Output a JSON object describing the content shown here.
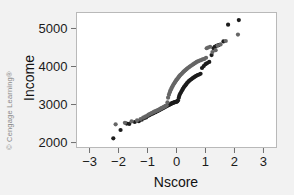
{
  "figure": {
    "credit": "© Cengage Learning®",
    "background_color": "#f2f2f2",
    "plot_background_color": "#ffffff",
    "frame_color": "#b9b9b9",
    "axis_color": "#6f6f6f"
  },
  "chart_data": {
    "type": "scatter",
    "title": "",
    "xlabel": "Nscore",
    "ylabel": "Income",
    "xlim": [
      -3.45,
      3.45
    ],
    "ylim": [
      1870,
      5420
    ],
    "xticks": [
      -3,
      -2,
      -1,
      0,
      1,
      2,
      3
    ],
    "xtick_labels": [
      "−3",
      "−2",
      "−1",
      "0",
      "1",
      "2",
      "3"
    ],
    "yticks": [
      2000,
      3000,
      4000,
      5000
    ],
    "ytick_labels": [
      "2000",
      "3000",
      "4000",
      "5000"
    ],
    "grid": false,
    "legend": "none",
    "marker": "filled-circle",
    "marker_size_px": 4.2,
    "series": [
      {
        "name": "lower-band",
        "color": "#1c1c1c",
        "points": [
          [
            -2.18,
            2110
          ],
          [
            -1.93,
            2330
          ],
          [
            -1.72,
            2500
          ],
          [
            -1.63,
            2490
          ],
          [
            -1.44,
            2540
          ],
          [
            -1.3,
            2560
          ],
          [
            -1.2,
            2600
          ],
          [
            -1.12,
            2640
          ],
          [
            -1.05,
            2660
          ],
          [
            -0.99,
            2700
          ],
          [
            -0.94,
            2720
          ],
          [
            -0.89,
            2740
          ],
          [
            -0.84,
            2760
          ],
          [
            -0.8,
            2770
          ],
          [
            -0.76,
            2790
          ],
          [
            -0.72,
            2800
          ],
          [
            -0.68,
            2820
          ],
          [
            -0.64,
            2830
          ],
          [
            -0.61,
            2850
          ],
          [
            -0.57,
            2860
          ],
          [
            -0.54,
            2880
          ],
          [
            -0.51,
            2890
          ],
          [
            -0.48,
            2900
          ],
          [
            -0.45,
            2915
          ],
          [
            -0.42,
            2925
          ],
          [
            -0.39,
            2940
          ],
          [
            -0.36,
            2950
          ],
          [
            -0.33,
            2965
          ],
          [
            -0.3,
            2975
          ],
          [
            -0.28,
            2985
          ],
          [
            -0.25,
            2995
          ],
          [
            -0.22,
            3005
          ],
          [
            -0.2,
            3015
          ],
          [
            -0.17,
            3025
          ],
          [
            -0.15,
            3035
          ],
          [
            -0.12,
            3045
          ],
          [
            -0.1,
            3050
          ],
          [
            -0.07,
            3060
          ],
          [
            -0.05,
            3065
          ],
          [
            -0.02,
            3070
          ],
          [
            0.0,
            3075
          ],
          [
            0.03,
            3085
          ],
          [
            0.05,
            3110
          ],
          [
            0.08,
            3180
          ],
          [
            0.1,
            3240
          ],
          [
            0.13,
            3290
          ],
          [
            0.16,
            3330
          ],
          [
            0.19,
            3370
          ],
          [
            0.22,
            3410
          ],
          [
            0.25,
            3450
          ],
          [
            0.28,
            3480
          ],
          [
            0.31,
            3510
          ],
          [
            0.34,
            3540
          ],
          [
            0.37,
            3570
          ],
          [
            0.41,
            3600
          ],
          [
            0.44,
            3625
          ],
          [
            0.48,
            3650
          ],
          [
            0.52,
            3670
          ],
          [
            0.56,
            3695
          ],
          [
            0.6,
            3715
          ],
          [
            0.64,
            3735
          ],
          [
            0.68,
            3755
          ],
          [
            0.73,
            3775
          ],
          [
            0.78,
            3790
          ],
          [
            0.83,
            3810
          ],
          [
            0.88,
            3960
          ],
          [
            0.94,
            4010
          ],
          [
            1.0,
            4060
          ],
          [
            1.06,
            4090
          ],
          [
            1.13,
            4120
          ],
          [
            1.21,
            4300
          ],
          [
            1.28,
            4480
          ],
          [
            1.32,
            4520
          ],
          [
            1.38,
            4545
          ],
          [
            1.45,
            4560
          ],
          [
            1.62,
            4660
          ],
          [
            1.78,
            5100
          ],
          [
            2.15,
            5220
          ]
        ]
      },
      {
        "name": "upper-band",
        "color": "#666666",
        "points": [
          [
            -2.1,
            2480
          ],
          [
            -1.78,
            2520
          ],
          [
            -1.55,
            2555
          ],
          [
            -1.36,
            2585
          ],
          [
            -1.24,
            2620
          ],
          [
            -1.15,
            2655
          ],
          [
            -1.08,
            2680
          ],
          [
            -1.01,
            2710
          ],
          [
            -0.96,
            2735
          ],
          [
            -0.91,
            2755
          ],
          [
            -0.86,
            2775
          ],
          [
            -0.82,
            2790
          ],
          [
            -0.78,
            2805
          ],
          [
            -0.74,
            2820
          ],
          [
            -0.7,
            2835
          ],
          [
            -0.66,
            2848
          ],
          [
            -0.62,
            2862
          ],
          [
            -0.59,
            2875
          ],
          [
            -0.55,
            2890
          ],
          [
            -0.52,
            2902
          ],
          [
            -0.49,
            2915
          ],
          [
            -0.46,
            2928
          ],
          [
            -0.43,
            2940
          ],
          [
            -0.4,
            2952
          ],
          [
            -0.37,
            2965
          ],
          [
            -0.34,
            2978
          ],
          [
            -0.31,
            3060
          ],
          [
            -0.29,
            3180
          ],
          [
            -0.26,
            3260
          ],
          [
            -0.23,
            3320
          ],
          [
            -0.21,
            3370
          ],
          [
            -0.18,
            3410
          ],
          [
            -0.16,
            3450
          ],
          [
            -0.13,
            3485
          ],
          [
            -0.11,
            3520
          ],
          [
            -0.08,
            3550
          ],
          [
            -0.06,
            3580
          ],
          [
            -0.03,
            3610
          ],
          [
            -0.01,
            3640
          ],
          [
            0.02,
            3665
          ],
          [
            0.04,
            3690
          ],
          [
            0.07,
            3715
          ],
          [
            0.09,
            3740
          ],
          [
            0.12,
            3765
          ],
          [
            0.15,
            3790
          ],
          [
            0.18,
            3810
          ],
          [
            0.21,
            3835
          ],
          [
            0.24,
            3860
          ],
          [
            0.27,
            3880
          ],
          [
            0.3,
            3900
          ],
          [
            0.33,
            3920
          ],
          [
            0.36,
            3940
          ],
          [
            0.39,
            3960
          ],
          [
            0.43,
            3980
          ],
          [
            0.46,
            4000
          ],
          [
            0.5,
            4020
          ],
          [
            0.54,
            4040
          ],
          [
            0.58,
            4060
          ],
          [
            0.62,
            4080
          ],
          [
            0.66,
            4100
          ],
          [
            0.7,
            4120
          ],
          [
            0.75,
            4140
          ],
          [
            0.8,
            4155
          ],
          [
            0.85,
            4170
          ],
          [
            0.9,
            4185
          ],
          [
            0.96,
            4200
          ],
          [
            1.02,
            4230
          ],
          [
            1.04,
            4480
          ],
          [
            1.09,
            4500
          ],
          [
            1.16,
            4520
          ],
          [
            1.24,
            4380
          ],
          [
            1.35,
            4430
          ],
          [
            1.42,
            4550
          ],
          [
            1.52,
            4580
          ],
          [
            1.7,
            4670
          ],
          [
            2.12,
            4840
          ]
        ]
      }
    ]
  }
}
